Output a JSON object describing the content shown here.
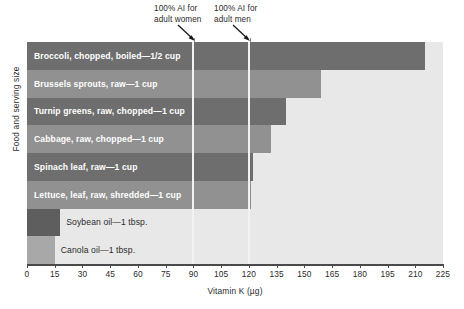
{
  "chart_data": {
    "type": "bar",
    "orientation": "horizontal",
    "title": "",
    "xlabel": "Vitamin K (µg)",
    "ylabel": "Food and serving size",
    "xlim": [
      0,
      225
    ],
    "xticks": [
      0,
      15,
      30,
      45,
      60,
      75,
      90,
      105,
      120,
      135,
      150,
      165,
      180,
      195,
      210,
      225
    ],
    "grid": false,
    "legend": "none",
    "categories": [
      "Broccoli, chopped, boiled—1/2 cup",
      "Brussels sprouts, raw—1 cup",
      "Turnip greens, raw, chopped—1 cup",
      "Cabbage, raw, chopped—1 cup",
      "Spinach leaf, raw—1 cup",
      "Lettuce, leaf, raw, shredded—1 cup",
      "Soybean oil—1 tbsp.",
      "Canola oil—1 tbsp."
    ],
    "values": [
      215,
      159,
      140,
      132,
      122,
      121,
      18,
      15
    ],
    "bars": [
      {
        "label": "Broccoli, chopped, boiled—1/2 cup",
        "value": 215,
        "color": "#6e6e6e",
        "label_placement": "inside"
      },
      {
        "label": "Brussels sprouts, raw—1 cup",
        "value": 159,
        "color": "#919191",
        "label_placement": "inside"
      },
      {
        "label": "Turnip greens, raw, chopped—1 cup",
        "value": 140,
        "color": "#6e6e6e",
        "label_placement": "inside"
      },
      {
        "label": "Cabbage, raw, chopped—1 cup",
        "value": 132,
        "color": "#919191",
        "label_placement": "inside"
      },
      {
        "label": "Spinach leaf, raw—1 cup",
        "value": 122,
        "color": "#6e6e6e",
        "label_placement": "inside"
      },
      {
        "label": "Lettuce, leaf, raw, shredded—1 cup",
        "value": 121,
        "color": "#919191",
        "label_placement": "inside"
      },
      {
        "label": "Soybean oil—1 tbsp.",
        "value": 18,
        "color": "#5e5e5e",
        "label_placement": "outside"
      },
      {
        "label": "Canola oil—1 tbsp.",
        "value": 15,
        "color": "#a8a8a8",
        "label_placement": "outside"
      }
    ],
    "reference_lines": [
      {
        "value": 90,
        "label_line1": "100% AI for",
        "label_line2": "adult women",
        "color": "#f2f2f2"
      },
      {
        "value": 120,
        "label_line1": "100% AI for",
        "label_line2": "adult men",
        "color": "#f2f2f2"
      }
    ],
    "colors": {
      "plot_background": "#e8e8e8",
      "bar_dark": "#6e6e6e",
      "bar_light": "#919191",
      "axis": "#4a4a4a",
      "text": "#2b2b2b"
    }
  }
}
